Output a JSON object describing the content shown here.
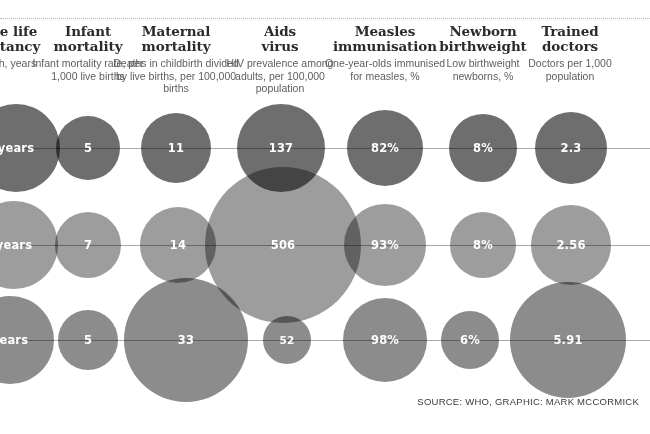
{
  "figure": {
    "source_note": "SOURCE: WHO, GRAPHIC: MARK MCCORMICK",
    "colors": {
      "row1_bubble": "#6e6e6e",
      "row2_bubble": "#9d9d9d",
      "row3_bubble": "#8c8c8c",
      "connector": "#a9a9a9",
      "title_text": "#2b2b2b",
      "subtitle_text": "#5e5e5e",
      "value_text": "#ffffff",
      "background": "#ffffff"
    }
  },
  "columns": [
    {
      "title": "Male life\nexpectancy",
      "title_line1": "le life",
      "title_line2": "ctancy",
      "subtitle": "th, years",
      "center_x": 16,
      "clipped": true
    },
    {
      "title_line1": "Infant",
      "title_line2": "mortality",
      "subtitle": "Infant mortality rate, per 1,000 live births",
      "center_x": 88,
      "clipped": false
    },
    {
      "title_line1": "Maternal",
      "title_line2": "mortality",
      "subtitle": "Deaths in childbirth divided by live births, per 100,000 births",
      "center_x": 176,
      "clipped": false
    },
    {
      "title_line1": "Aids",
      "title_line2": "virus",
      "subtitle": "HIV prevalence among adults, per 100,000 population",
      "center_x": 280,
      "clipped": false
    },
    {
      "title_line1": "Measles",
      "title_line2": "immunisation",
      "subtitle": "One-year-olds immunised for measles, %",
      "center_x": 385,
      "clipped": false
    },
    {
      "title_line1": "Newborn",
      "title_line2": "birthweight",
      "subtitle": "Low birthweight newborns, %",
      "center_x": 483,
      "clipped": false
    },
    {
      "title_line1": "Trained",
      "title_line2": "doctors",
      "subtitle": "Doctors per 1,000 population",
      "center_x": 570,
      "clipped": false
    }
  ],
  "chart_data": {
    "type": "bubble",
    "title": "",
    "xlabel": "",
    "ylabel": "",
    "grid": false,
    "legend": "none",
    "categories": [
      "Male life expectancy",
      "Infant mortality",
      "Maternal mortality",
      "Aids virus",
      "Measles immunisation",
      "Newborn birthweight",
      "Trained doctors"
    ],
    "category_units": [
      "At birth, years",
      "Infant mortality rate, per 1,000 live births",
      "Deaths in childbirth divided by live births, per 100,000 births",
      "HIV prevalence among adults, per 100,000 population",
      "One-year-olds immunised for measles, %",
      "Low birthweight newborns, %",
      "Doctors per 1,000 population"
    ],
    "series": [
      {
        "name": "row-1",
        "row_index": 1,
        "color": "#6e6e6e",
        "labels": [
          "years",
          "5",
          "11",
          "137",
          "82%",
          "8%",
          "2.3"
        ],
        "values": [
          null,
          5,
          11,
          137,
          82,
          8,
          2.3
        ]
      },
      {
        "name": "row-2",
        "row_index": 2,
        "color": "#9d9d9d",
        "labels": [
          "years",
          "7",
          "14",
          "506",
          "93%",
          "8%",
          "2.56"
        ],
        "values": [
          null,
          7,
          14,
          506,
          93,
          8,
          2.56
        ]
      },
      {
        "name": "row-3",
        "row_index": 3,
        "color": "#8c8c8c",
        "labels": [
          "years",
          "5",
          "33",
          "52",
          "98%",
          "6%",
          "5.91"
        ],
        "values": [
          null,
          5,
          33,
          52,
          98,
          6,
          5.91
        ]
      }
    ]
  },
  "bubbles": [
    {
      "id": "r1c0",
      "row": 1,
      "col": 0,
      "label": "years",
      "cx": 16,
      "cy": 148,
      "r": 44
    },
    {
      "id": "r1c1",
      "row": 1,
      "col": 1,
      "label": "5",
      "cx": 88,
      "cy": 148,
      "r": 32
    },
    {
      "id": "r1c2",
      "row": 1,
      "col": 2,
      "label": "11",
      "cx": 176,
      "cy": 148,
      "r": 35
    },
    {
      "id": "r1c3",
      "row": 1,
      "col": 3,
      "label": "137",
      "cx": 281,
      "cy": 148,
      "r": 44
    },
    {
      "id": "r1c4",
      "row": 1,
      "col": 4,
      "label": "82%",
      "cx": 385,
      "cy": 148,
      "r": 38
    },
    {
      "id": "r1c5",
      "row": 1,
      "col": 5,
      "label": "8%",
      "cx": 483,
      "cy": 148,
      "r": 34
    },
    {
      "id": "r1c6",
      "row": 1,
      "col": 6,
      "label": "2.3",
      "cx": 571,
      "cy": 148,
      "r": 36
    },
    {
      "id": "r2c0",
      "row": 2,
      "col": 0,
      "label": "years",
      "cx": 14,
      "cy": 245,
      "r": 44
    },
    {
      "id": "r2c1",
      "row": 2,
      "col": 1,
      "label": "7",
      "cx": 88,
      "cy": 245,
      "r": 33
    },
    {
      "id": "r2c2",
      "row": 2,
      "col": 2,
      "label": "14",
      "cx": 178,
      "cy": 245,
      "r": 38
    },
    {
      "id": "r2c3",
      "row": 2,
      "col": 3,
      "label": "506",
      "cx": 283,
      "cy": 245,
      "r": 78
    },
    {
      "id": "r2c4",
      "row": 2,
      "col": 4,
      "label": "93%",
      "cx": 385,
      "cy": 245,
      "r": 41
    },
    {
      "id": "r2c5",
      "row": 2,
      "col": 5,
      "label": "8%",
      "cx": 483,
      "cy": 245,
      "r": 33
    },
    {
      "id": "r2c6",
      "row": 2,
      "col": 6,
      "label": "2.56",
      "cx": 571,
      "cy": 245,
      "r": 40
    },
    {
      "id": "r3c0",
      "row": 3,
      "col": 0,
      "label": "years",
      "cx": 10,
      "cy": 340,
      "r": 44
    },
    {
      "id": "r3c1",
      "row": 3,
      "col": 1,
      "label": "5",
      "cx": 88,
      "cy": 340,
      "r": 30
    },
    {
      "id": "r3c2",
      "row": 3,
      "col": 2,
      "label": "33",
      "cx": 186,
      "cy": 340,
      "r": 62
    },
    {
      "id": "r3c3",
      "row": 3,
      "col": 3,
      "label": "52",
      "cx": 287,
      "cy": 340,
      "r": 24
    },
    {
      "id": "r3c4",
      "row": 3,
      "col": 4,
      "label": "98%",
      "cx": 385,
      "cy": 340,
      "r": 42
    },
    {
      "id": "r3c5",
      "row": 3,
      "col": 5,
      "label": "6%",
      "cx": 470,
      "cy": 340,
      "r": 29
    },
    {
      "id": "r3c6",
      "row": 3,
      "col": 6,
      "label": "5.91",
      "cx": 568,
      "cy": 340,
      "r": 58
    }
  ],
  "connectors": [
    {
      "id": "r1",
      "row": 1,
      "y": 148,
      "x1": 0,
      "x2": 650
    },
    {
      "id": "r2",
      "row": 2,
      "y": 245,
      "x1": 0,
      "x2": 650
    },
    {
      "id": "r3",
      "row": 3,
      "y": 340,
      "x1": 0,
      "x2": 650
    }
  ]
}
